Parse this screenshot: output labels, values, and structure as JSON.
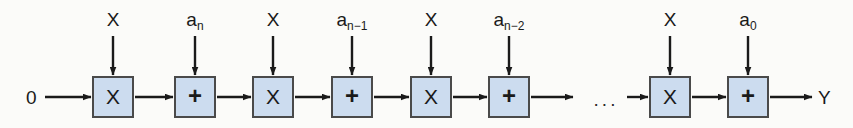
{
  "figure": {
    "background_color": "#fbfbf9",
    "box_fill_color": "#ccdcef",
    "box_border_color": "#4a4a4a",
    "line_color": "#1a1a1a"
  },
  "input": {
    "initial_value_label": "0"
  },
  "output": {
    "result_label": "Y"
  },
  "continuation": {
    "ellipsis": "..."
  },
  "stages": [
    {
      "index": 0,
      "multiply": {
        "glyph": "X",
        "top_label_text": "X",
        "top_label_base": "X",
        "top_label_sub": ""
      },
      "add": {
        "glyph": "+",
        "top_label_text": "a n",
        "top_label_base": "a",
        "top_label_sub": "n"
      }
    },
    {
      "index": 1,
      "multiply": {
        "glyph": "X",
        "top_label_text": "X",
        "top_label_base": "X",
        "top_label_sub": ""
      },
      "add": {
        "glyph": "+",
        "top_label_text": "a n-1",
        "top_label_base": "a",
        "top_label_sub": "n−1"
      }
    },
    {
      "index": 2,
      "multiply": {
        "glyph": "X",
        "top_label_text": "X",
        "top_label_base": "X",
        "top_label_sub": ""
      },
      "add": {
        "glyph": "+",
        "top_label_text": "a n-2",
        "top_label_base": "a",
        "top_label_sub": "n−2"
      }
    },
    {
      "index": 3,
      "multiply": {
        "glyph": "X",
        "top_label_text": "X",
        "top_label_base": "X",
        "top_label_sub": ""
      },
      "add": {
        "glyph": "+",
        "top_label_text": "a 0",
        "top_label_base": "a",
        "top_label_sub": "0"
      }
    }
  ]
}
